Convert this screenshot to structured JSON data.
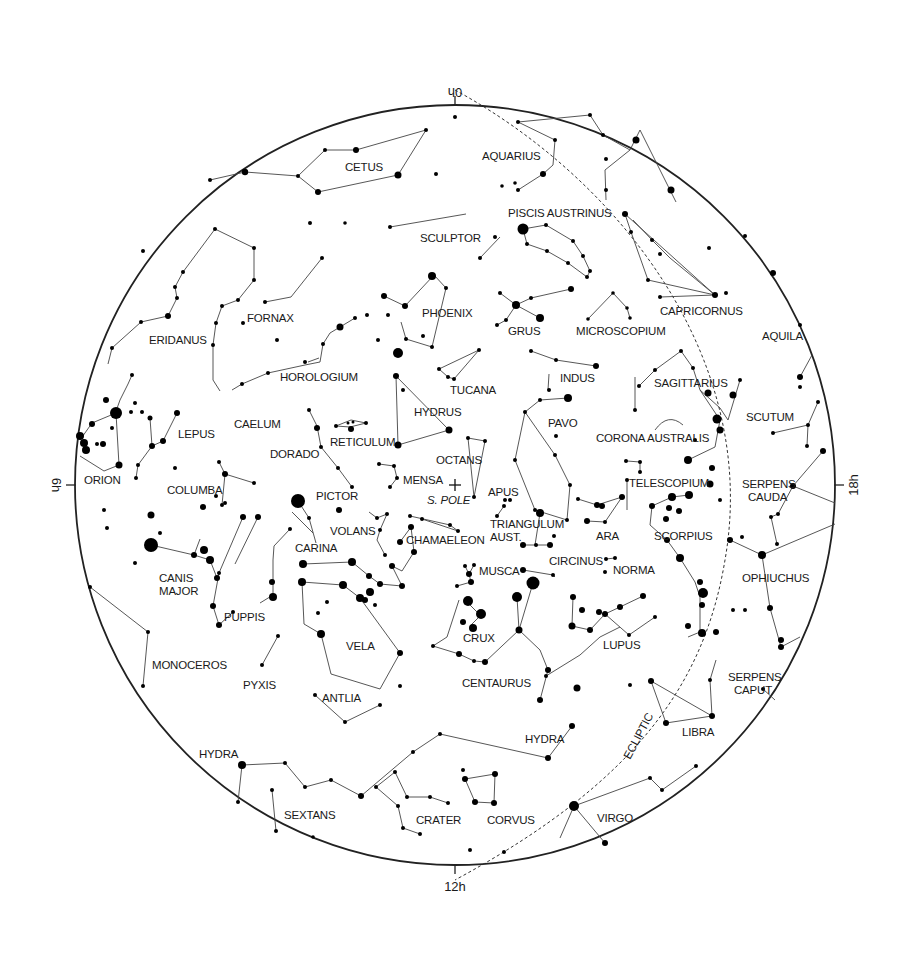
{
  "chart_title": "Southern Sky Star Chart",
  "colors": {
    "background": "#ffffff",
    "ink": "#000000",
    "lines": "#444444"
  },
  "frame": {
    "cx": 455,
    "cy": 485,
    "r": 380
  },
  "hour_labels": {
    "top": "0h",
    "left": "6h",
    "right": "18h",
    "bottom": "12h"
  },
  "pole": {
    "label": "S. POLE",
    "x": 455,
    "y": 485
  },
  "ecliptic": {
    "label": "ECLIPTIC"
  },
  "constellations": [
    {
      "name": "CETUS",
      "x": 345,
      "y": 171
    },
    {
      "name": "AQUARIUS",
      "x": 482,
      "y": 160
    },
    {
      "name": "PISCIS AUSTRINUS",
      "x": 508,
      "y": 217
    },
    {
      "name": "SCULPTOR",
      "x": 420,
      "y": 242
    },
    {
      "name": "ERIDANUS",
      "x": 149,
      "y": 344
    },
    {
      "name": "FORNAX",
      "x": 247,
      "y": 322
    },
    {
      "name": "PHOENIX",
      "x": 422,
      "y": 317
    },
    {
      "name": "GRUS",
      "x": 508,
      "y": 335
    },
    {
      "name": "MICROSCOPIUM",
      "x": 576,
      "y": 335
    },
    {
      "name": "CAPRICORNUS",
      "x": 660,
      "y": 315
    },
    {
      "name": "AQUILA",
      "x": 762,
      "y": 340
    },
    {
      "name": "HOROLOGIUM",
      "x": 280,
      "y": 381
    },
    {
      "name": "TUCANA",
      "x": 450,
      "y": 394
    },
    {
      "name": "INDUS",
      "x": 560,
      "y": 382
    },
    {
      "name": "SAGITTARIUS",
      "x": 654,
      "y": 387
    },
    {
      "name": "LEPUS",
      "x": 178,
      "y": 438
    },
    {
      "name": "CAELUM",
      "x": 234,
      "y": 428
    },
    {
      "name": "HYDRUS",
      "x": 414,
      "y": 416
    },
    {
      "name": "RETICULUM",
      "x": 330,
      "y": 446
    },
    {
      "name": "PAVO",
      "x": 548,
      "y": 427
    },
    {
      "name": "SCUTUM",
      "x": 746,
      "y": 421
    },
    {
      "name": "CORONA AUSTRALIS",
      "x": 596,
      "y": 442
    },
    {
      "name": "DORADO",
      "x": 270,
      "y": 458
    },
    {
      "name": "OCTANS",
      "x": 436,
      "y": 464
    },
    {
      "name": "MENSA",
      "x": 403,
      "y": 484
    },
    {
      "name": "ORION",
      "x": 84,
      "y": 484
    },
    {
      "name": "COLUMBA",
      "x": 167,
      "y": 494
    },
    {
      "name": "PICTOR",
      "x": 316,
      "y": 500
    },
    {
      "name": "APUS",
      "x": 488,
      "y": 496
    },
    {
      "name": "TELESCOPIUM",
      "x": 629,
      "y": 487
    },
    {
      "name": "SERPENS CAUDA",
      "x": 742,
      "y": 488
    },
    {
      "name": "VOLANS",
      "x": 330,
      "y": 535
    },
    {
      "name": "TRIANGULUM AUST.",
      "x": 490,
      "y": 528
    },
    {
      "name": "ARA",
      "x": 596,
      "y": 540
    },
    {
      "name": "SCORPIUS",
      "x": 654,
      "y": 540
    },
    {
      "name": "CARINA",
      "x": 295,
      "y": 552
    },
    {
      "name": "CHAMAELEON",
      "x": 406,
      "y": 544
    },
    {
      "name": "CIRCINUS",
      "x": 549,
      "y": 565
    },
    {
      "name": "CANIS MAJOR",
      "x": 159,
      "y": 582
    },
    {
      "name": "MUSCA",
      "x": 479,
      "y": 575
    },
    {
      "name": "NORMA",
      "x": 613,
      "y": 574
    },
    {
      "name": "OPHIUCHUS",
      "x": 742,
      "y": 582
    },
    {
      "name": "PUPPIS",
      "x": 224,
      "y": 621
    },
    {
      "name": "CRUX",
      "x": 463,
      "y": 642
    },
    {
      "name": "LUPUS",
      "x": 603,
      "y": 649
    },
    {
      "name": "VELA",
      "x": 346,
      "y": 650
    },
    {
      "name": "MONOCEROS",
      "x": 152,
      "y": 669
    },
    {
      "name": "CENTAURUS",
      "x": 462,
      "y": 687
    },
    {
      "name": "PYXIS",
      "x": 243,
      "y": 689
    },
    {
      "name": "ANTLIA",
      "x": 322,
      "y": 702
    },
    {
      "name": "SERPENS CAPUT",
      "x": 728,
      "y": 681
    },
    {
      "name": "LIBRA",
      "x": 682,
      "y": 736
    },
    {
      "name": "HYDRA",
      "x": 525,
      "y": 743
    },
    {
      "name": "HYDRA",
      "x": 199,
      "y": 758
    },
    {
      "name": "SEXTANS",
      "x": 284,
      "y": 819
    },
    {
      "name": "CRATER",
      "x": 416,
      "y": 824
    },
    {
      "name": "CORVUS",
      "x": 487,
      "y": 824
    },
    {
      "name": "VIRGO",
      "x": 597,
      "y": 822
    }
  ]
}
